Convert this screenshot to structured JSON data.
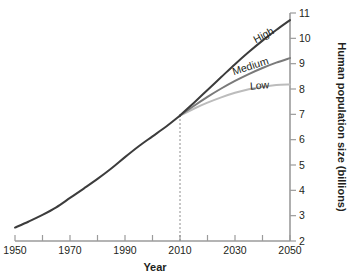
{
  "chart_data": {
    "type": "line",
    "title": "",
    "xlabel": "Year",
    "ylabel": "Human population size (billions)",
    "xlim": [
      1950,
      2050
    ],
    "ylim": [
      2,
      11
    ],
    "grid": false,
    "legend_position": "inline-end-of-line",
    "x_ticks": [
      1950,
      1960,
      1970,
      1980,
      1990,
      2000,
      2010,
      2020,
      2030,
      2040,
      2050
    ],
    "x_tick_labels": [
      "1950",
      "",
      "1970",
      "",
      "1990",
      "",
      "2010",
      "",
      "2030",
      "",
      "2050"
    ],
    "y_ticks": [
      2,
      3,
      4,
      5,
      6,
      7,
      8,
      9,
      10,
      11
    ],
    "y_tick_labels": [
      "2",
      "3",
      "4",
      "5",
      "6",
      "7",
      "8",
      "9",
      "10",
      "11"
    ],
    "y_axis_side": "right",
    "annotations": [
      {
        "name": "projection-divider",
        "type": "vertical-dashed-line",
        "x": 2010,
        "y_from": 2,
        "y_to": 6.95,
        "label": ""
      }
    ],
    "series": [
      {
        "name": "Historical",
        "label": "",
        "color": "#3c3c3c",
        "width": 2.0,
        "x": [
          1950,
          1955,
          1960,
          1965,
          1970,
          1975,
          1980,
          1985,
          1990,
          1995,
          2000,
          2005,
          2010
        ],
        "values": [
          2.53,
          2.77,
          3.03,
          3.33,
          3.7,
          4.07,
          4.45,
          4.86,
          5.31,
          5.74,
          6.13,
          6.52,
          6.95
        ]
      },
      {
        "name": "High",
        "label": "High",
        "color": "#3c3c3c",
        "width": 2.0,
        "x": [
          2010,
          2015,
          2020,
          2025,
          2030,
          2035,
          2040,
          2045,
          2050
        ],
        "values": [
          6.95,
          7.45,
          7.96,
          8.47,
          8.98,
          9.46,
          9.91,
          10.33,
          10.72
        ]
      },
      {
        "name": "Medium",
        "label": "Medium",
        "color": "#7a7a7a",
        "width": 2.0,
        "x": [
          2010,
          2015,
          2020,
          2025,
          2030,
          2035,
          2040,
          2045,
          2050
        ],
        "values": [
          6.95,
          7.33,
          7.69,
          8.02,
          8.32,
          8.59,
          8.83,
          9.04,
          9.22
        ]
      },
      {
        "name": "Low",
        "label": "Low",
        "color": "#bcbcbc",
        "width": 2.0,
        "x": [
          2010,
          2015,
          2020,
          2025,
          2030,
          2035,
          2040,
          2045,
          2050
        ],
        "values": [
          6.95,
          7.22,
          7.46,
          7.67,
          7.85,
          7.99,
          8.09,
          8.16,
          8.18
        ]
      }
    ],
    "series_label_placement": [
      {
        "name": "High",
        "x": 2041,
        "y": 10.0,
        "rotation": -28
      },
      {
        "name": "Medium",
        "x": 2036,
        "y": 8.77,
        "rotation": -18
      },
      {
        "name": "Low",
        "x": 2039,
        "y": 8.0,
        "rotation": -4
      }
    ]
  }
}
